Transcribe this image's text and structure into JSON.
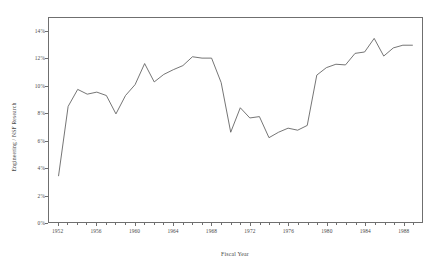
{
  "chart_data": {
    "type": "line",
    "title": "",
    "subtitle": "",
    "xlabel": "Fiscal Year",
    "ylabel": "Engineering / NSF Research",
    "xlim": [
      1951,
      1990
    ],
    "ylim": [
      0,
      15
    ],
    "grid": false,
    "legend": null,
    "annotations": [],
    "y_tick_labels": [
      "0%",
      "2%",
      "4%",
      "6%",
      "8%",
      "10%",
      "12%",
      "14%"
    ],
    "y_tick_values": [
      0,
      2,
      4,
      6,
      8,
      10,
      12,
      14
    ],
    "x_tick_labels": [
      "1952",
      "1956",
      "1960",
      "1964",
      "1968",
      "1972",
      "1976",
      "1980",
      "1984",
      "1988"
    ],
    "x_tick_values": [
      1952,
      1956,
      1960,
      1964,
      1968,
      1972,
      1976,
      1980,
      1984,
      1988
    ],
    "series": [
      {
        "name": "Engineering / NSF Research",
        "color": "#5a5a5a",
        "x": [
          1952,
          1953,
          1954,
          1955,
          1956,
          1957,
          1958,
          1959,
          1960,
          1961,
          1962,
          1963,
          1964,
          1965,
          1966,
          1967,
          1968,
          1969,
          1970,
          1971,
          1972,
          1973,
          1974,
          1975,
          1976,
          1977,
          1978,
          1979,
          1980,
          1981,
          1982,
          1983,
          1984,
          1985,
          1986,
          1987,
          1988,
          1989
        ],
        "values": [
          3.4,
          8.5,
          9.75,
          9.4,
          9.55,
          9.3,
          7.95,
          9.3,
          10.1,
          11.65,
          10.3,
          10.85,
          11.2,
          11.5,
          12.15,
          12.05,
          12.05,
          10.25,
          6.6,
          8.4,
          7.65,
          7.75,
          6.2,
          6.6,
          6.9,
          6.75,
          7.1,
          10.8,
          11.35,
          11.6,
          11.55,
          12.4,
          12.5,
          13.5,
          12.2,
          12.8,
          13.0,
          13.0
        ]
      }
    ]
  },
  "figure": {
    "axis_color": "#6f6f6f",
    "text_color": "#4a4a4a",
    "background": "#ffffff"
  }
}
